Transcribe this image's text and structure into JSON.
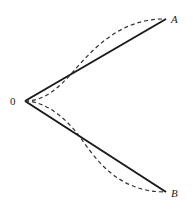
{
  "diagram": {
    "points": {
      "origin": {
        "label": "0",
        "x": 25,
        "y": 101
      },
      "A": {
        "label": "A",
        "x": 166,
        "y": 19
      },
      "B": {
        "label": "B",
        "x": 166,
        "y": 192
      }
    },
    "solid_segments": [
      "0-A",
      "0-B"
    ],
    "dashed_curves": [
      "0-A (curved, crossing midpoint)",
      "0-B (curved, crossing midpoint)"
    ],
    "colors": {
      "line": "#1a1a1a",
      "dashed": "#333333",
      "background": "#ffffff"
    }
  }
}
